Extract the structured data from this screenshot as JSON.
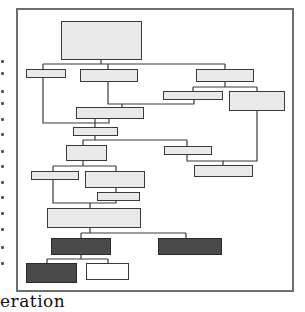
{
  "figure": {
    "caption_fragment": "eration",
    "frame_color": "#6e6e6e",
    "node_fill_light": "#e9e9e9",
    "node_fill_dark": "#4a4a4a",
    "node_fill_white": "#ffffff",
    "nodes": [
      {
        "id": "n1",
        "x": 61,
        "y": 21,
        "w": 81,
        "h": 39,
        "fill": "light"
      },
      {
        "id": "n2",
        "x": 26,
        "y": 69,
        "w": 40,
        "h": 9,
        "fill": "light"
      },
      {
        "id": "n3",
        "x": 80,
        "y": 69,
        "w": 58,
        "h": 13,
        "fill": "light"
      },
      {
        "id": "n4",
        "x": 196,
        "y": 69,
        "w": 58,
        "h": 13,
        "fill": "light"
      },
      {
        "id": "n5",
        "x": 163,
        "y": 91,
        "w": 60,
        "h": 9,
        "fill": "light"
      },
      {
        "id": "n6",
        "x": 229,
        "y": 91,
        "w": 56,
        "h": 20,
        "fill": "light"
      },
      {
        "id": "n7",
        "x": 76,
        "y": 107,
        "w": 68,
        "h": 12,
        "fill": "light"
      },
      {
        "id": "n8",
        "x": 73,
        "y": 127,
        "w": 45,
        "h": 9,
        "fill": "light"
      },
      {
        "id": "n9",
        "x": 66,
        "y": 145,
        "w": 41,
        "h": 16,
        "fill": "light"
      },
      {
        "id": "n10",
        "x": 164,
        "y": 146,
        "w": 48,
        "h": 9,
        "fill": "light"
      },
      {
        "id": "n11",
        "x": 194,
        "y": 165,
        "w": 59,
        "h": 12,
        "fill": "light"
      },
      {
        "id": "n12",
        "x": 31,
        "y": 171,
        "w": 48,
        "h": 9,
        "fill": "light"
      },
      {
        "id": "n13",
        "x": 85,
        "y": 171,
        "w": 60,
        "h": 17,
        "fill": "light"
      },
      {
        "id": "n14",
        "x": 97,
        "y": 192,
        "w": 43,
        "h": 9,
        "fill": "light"
      },
      {
        "id": "n15",
        "x": 47,
        "y": 208,
        "w": 94,
        "h": 20,
        "fill": "light"
      },
      {
        "id": "n16",
        "x": 51,
        "y": 238,
        "w": 60,
        "h": 17,
        "fill": "dark"
      },
      {
        "id": "n17",
        "x": 158,
        "y": 238,
        "w": 64,
        "h": 17,
        "fill": "dark"
      },
      {
        "id": "n18",
        "x": 26,
        "y": 263,
        "w": 51,
        "h": 20,
        "fill": "dark"
      },
      {
        "id": "n19",
        "x": 86,
        "y": 263,
        "w": 43,
        "h": 17,
        "fill": "white"
      }
    ],
    "edges": [
      "M101 60 V64 M43 64 H225 M43 64 V69 M108 64 V69 M225 64 V69",
      "M43 78 V123 H109 V119",
      "M108 82 V104 H194 V100",
      "M122 104 V107",
      "M225 82 V87 M193 87 H257 M193 87 V91 M257 87 V91",
      "M95 119 V127",
      "M95 136 V140 M83 140 H187 M83 140 V145 M187 140 V146",
      "M187 155 V161 H223 V165",
      "M257 111 V161 H223",
      "M83 161 V166 M53 166 H116 M53 166 V171 M116 166 V171",
      "M116 188 V192",
      "M53 180 V203 H116 V201",
      "M90 203 V208",
      "M90 228 V233 M81 233 H186 M81 233 V238 M186 233 V238",
      "M81 255 V259 M47 259 H108 M47 259 V263 M108 259 V263"
    ],
    "left_margin_marks_y": [
      60,
      72,
      90,
      102,
      118,
      133,
      150,
      165,
      181,
      196,
      212,
      228,
      246,
      262
    ]
  }
}
